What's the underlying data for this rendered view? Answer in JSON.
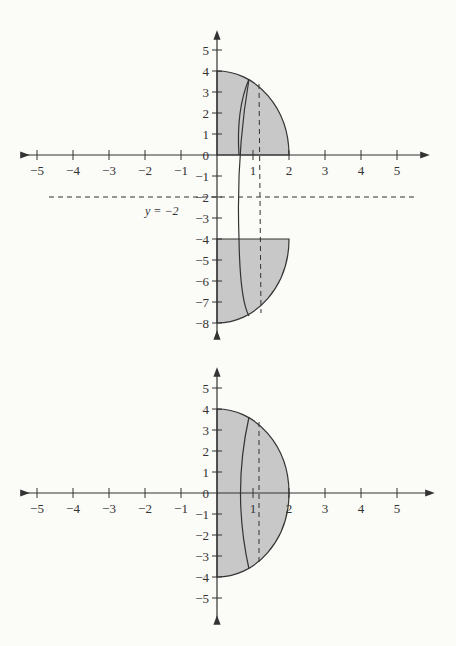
{
  "colors": {
    "shade": "#c8c8c8",
    "line": "#333333",
    "background": "#fbfbf8"
  },
  "top_graph": {
    "x_ticks": [
      "-5",
      "-4",
      "-3",
      "-2",
      "-1",
      "1",
      "2",
      "3",
      "4",
      "5"
    ],
    "y_ticks_pos": [
      "5",
      "4",
      "3",
      "2",
      "1",
      "0"
    ],
    "y_ticks_neg": [
      "-1",
      "-2",
      "-3",
      "-4",
      "-5",
      "-6",
      "-7",
      "-8"
    ],
    "line_label": "y = −2"
  },
  "bottom_graph": {
    "x_ticks": [
      "-5",
      "-4",
      "-3",
      "-2",
      "-1",
      "1",
      "2",
      "3",
      "4",
      "5"
    ],
    "y_ticks_pos": [
      "5",
      "4",
      "3",
      "2",
      "1",
      "0"
    ],
    "y_ticks_neg": [
      "-1",
      "-2",
      "-3",
      "-4",
      "-5"
    ]
  }
}
